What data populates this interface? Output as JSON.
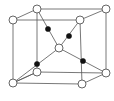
{
  "diagram": {
    "type": "crystal-unit-cell",
    "colors": {
      "line": "#555555",
      "open_atom": "#ffffff",
      "filled_atom": "#111111"
    },
    "corners": [
      {
        "id": "tfl",
        "x": 13,
        "y": 20
      },
      {
        "id": "tbl",
        "x": 37,
        "y": 9
      },
      {
        "id": "tbr",
        "x": 106,
        "y": 9
      },
      {
        "id": "tfr",
        "x": 80,
        "y": 20
      },
      {
        "id": "bfl",
        "x": 13,
        "y": 83
      },
      {
        "id": "bbl",
        "x": 37,
        "y": 72
      },
      {
        "id": "bbr",
        "x": 106,
        "y": 73
      },
      {
        "id": "bfr",
        "x": 82,
        "y": 84
      }
    ],
    "center": {
      "x": 59,
      "y": 48
    },
    "filled_atoms": [
      {
        "x": 48,
        "y": 29
      },
      {
        "x": 69,
        "y": 36
      },
      {
        "x": 37,
        "y": 64
      },
      {
        "x": 83,
        "y": 61
      }
    ]
  }
}
